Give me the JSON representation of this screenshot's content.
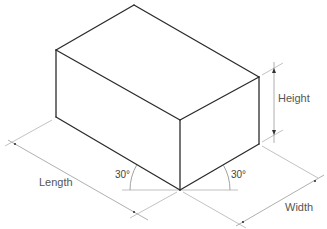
{
  "diagram": {
    "type": "isometric-box",
    "labels": {
      "height": "Height",
      "length": "Length",
      "width": "Width",
      "angle_left": "30°",
      "angle_right": "30°"
    },
    "colors": {
      "edge": "#2b2b2b",
      "dimension": "#9a9a9a",
      "text": "#555555"
    },
    "vertices": {
      "top_back": [
        134,
        5
      ],
      "top_left": [
        56,
        50
      ],
      "top_right": [
        259,
        77
      ],
      "top_front": [
        180,
        120
      ],
      "bottom_left": [
        56,
        117
      ],
      "bottom_front": [
        180,
        190
      ],
      "bottom_right": [
        259,
        144
      ]
    }
  }
}
